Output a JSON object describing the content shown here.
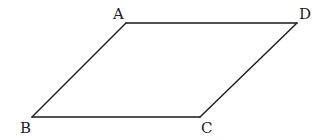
{
  "figure": {
    "type": "parallelogram",
    "colors": {
      "stroke": "#1a1a1a",
      "label": "#222222",
      "background": "#ffffff"
    },
    "vertices": [
      {
        "name": "A",
        "x": 126,
        "y": 23,
        "label_x": 113,
        "label_y": 19
      },
      {
        "name": "D",
        "x": 297,
        "y": 23,
        "label_x": 299,
        "label_y": 19
      },
      {
        "name": "C",
        "x": 200,
        "y": 117,
        "label_x": 201,
        "label_y": 133
      },
      {
        "name": "B",
        "x": 32,
        "y": 117,
        "label_x": 20,
        "label_y": 133
      }
    ],
    "edges": [
      {
        "name": "AD",
        "from": "A",
        "to": "D"
      },
      {
        "name": "DC",
        "from": "D",
        "to": "C"
      },
      {
        "name": "CB",
        "from": "C",
        "to": "B"
      },
      {
        "name": "BA",
        "from": "B",
        "to": "A"
      }
    ]
  }
}
